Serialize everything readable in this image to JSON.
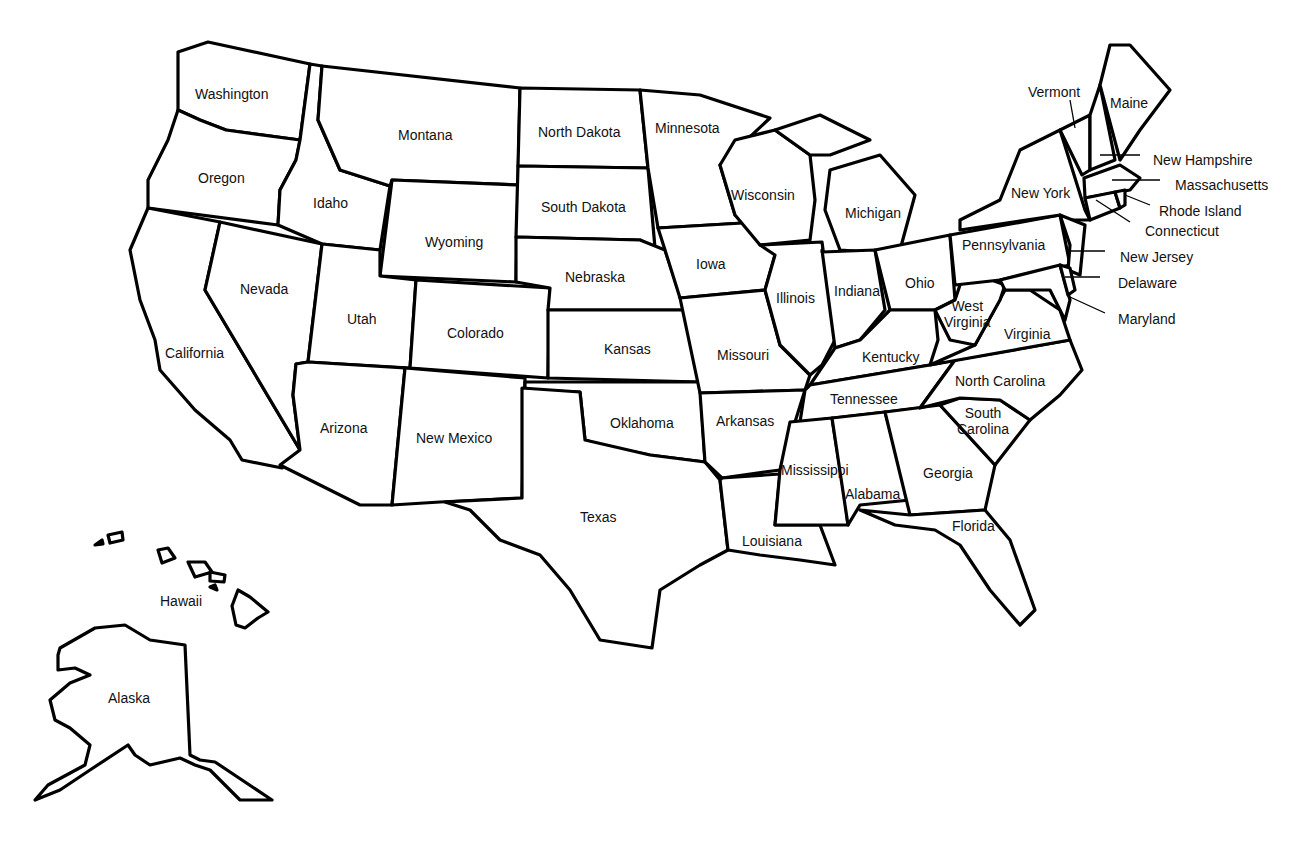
{
  "map": {
    "title": "United States",
    "background": "#ffffff",
    "stroke_color": "#000000",
    "states": [
      {
        "name": "Washington",
        "x": 195,
        "y": 86
      },
      {
        "name": "Oregon",
        "x": 198,
        "y": 170
      },
      {
        "name": "California",
        "x": 165,
        "y": 345
      },
      {
        "name": "Nevada",
        "x": 240,
        "y": 281
      },
      {
        "name": "Idaho",
        "x": 313,
        "y": 195
      },
      {
        "name": "Montana",
        "x": 398,
        "y": 127
      },
      {
        "name": "Wyoming",
        "x": 425,
        "y": 234
      },
      {
        "name": "Utah",
        "x": 347,
        "y": 311
      },
      {
        "name": "Colorado",
        "x": 447,
        "y": 325
      },
      {
        "name": "Arizona",
        "x": 320,
        "y": 420
      },
      {
        "name": "New Mexico",
        "x": 416,
        "y": 430
      },
      {
        "name": "North Dakota",
        "x": 538,
        "y": 124
      },
      {
        "name": "South Dakota",
        "x": 541,
        "y": 199
      },
      {
        "name": "Nebraska",
        "x": 565,
        "y": 269
      },
      {
        "name": "Kansas",
        "x": 604,
        "y": 341
      },
      {
        "name": "Oklahoma",
        "x": 610,
        "y": 415
      },
      {
        "name": "Texas",
        "x": 580,
        "y": 509
      },
      {
        "name": "Minnesota",
        "x": 655,
        "y": 120
      },
      {
        "name": "Iowa",
        "x": 696,
        "y": 256
      },
      {
        "name": "Missouri",
        "x": 717,
        "y": 347
      },
      {
        "name": "Arkansas",
        "x": 716,
        "y": 413
      },
      {
        "name": "Louisiana",
        "x": 742,
        "y": 533
      },
      {
        "name": "Wisconsin",
        "x": 731,
        "y": 187
      },
      {
        "name": "Illinois",
        "x": 776,
        "y": 290
      },
      {
        "name": "Michigan",
        "x": 845,
        "y": 205
      },
      {
        "name": "Indiana",
        "x": 834,
        "y": 283
      },
      {
        "name": "Ohio",
        "x": 905,
        "y": 275
      },
      {
        "name": "Kentucky",
        "x": 862,
        "y": 349
      },
      {
        "name": "Tennessee",
        "x": 830,
        "y": 391
      },
      {
        "name": "Mississippi",
        "x": 781,
        "y": 462
      },
      {
        "name": "Alabama",
        "x": 845,
        "y": 486
      },
      {
        "name": "Georgia",
        "x": 923,
        "y": 465
      },
      {
        "name": "Florida",
        "x": 952,
        "y": 518
      },
      {
        "name": "South Carolina",
        "x": 957,
        "y": 405,
        "multiline": [
          "South",
          "Carolina"
        ]
      },
      {
        "name": "North Carolina",
        "x": 955,
        "y": 373
      },
      {
        "name": "Virginia",
        "x": 1004,
        "y": 326
      },
      {
        "name": "West Virginia",
        "x": 944,
        "y": 298,
        "multiline": [
          "West",
          "Virginia"
        ]
      },
      {
        "name": "Pennsylvania",
        "x": 962,
        "y": 237
      },
      {
        "name": "New York",
        "x": 1011,
        "y": 185
      },
      {
        "name": "Vermont",
        "x": 1028,
        "y": 84
      },
      {
        "name": "Maine",
        "x": 1110,
        "y": 95
      },
      {
        "name": "Hawaii",
        "x": 160,
        "y": 593
      },
      {
        "name": "Alaska",
        "x": 108,
        "y": 690
      }
    ],
    "callouts": [
      {
        "name": "New Hampshire",
        "x": 1153,
        "y": 152
      },
      {
        "name": "Massachusetts",
        "x": 1175,
        "y": 177
      },
      {
        "name": "Rhode Island",
        "x": 1159,
        "y": 203
      },
      {
        "name": "Connecticut",
        "x": 1145,
        "y": 223
      },
      {
        "name": "New Jersey",
        "x": 1120,
        "y": 249
      },
      {
        "name": "Delaware",
        "x": 1118,
        "y": 275
      },
      {
        "name": "Maryland",
        "x": 1118,
        "y": 311
      }
    ]
  }
}
